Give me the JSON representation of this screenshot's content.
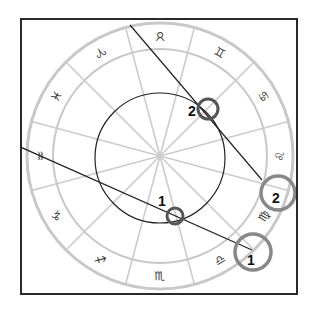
{
  "diagram": {
    "type": "zodiac-wheel",
    "colors": {
      "frame": "#2a2a2a",
      "wheel_ring": "#c8c8c8",
      "spokes": "#cccccc",
      "inner_circle": "#222222",
      "lines": "#222222",
      "small_markers": "#555555",
      "large_markers": "#888888"
    },
    "signs": [
      {
        "name": "taurus",
        "glyph": "♉"
      },
      {
        "name": "aries-mirrored",
        "glyph": "♈"
      },
      {
        "name": "pisces",
        "glyph": "♓"
      },
      {
        "name": "aquarius",
        "glyph": "♒"
      },
      {
        "name": "capricorn",
        "glyph": "♑"
      },
      {
        "name": "sagittarius",
        "glyph": "♐"
      },
      {
        "name": "scorpio",
        "glyph": "♏"
      },
      {
        "name": "libra",
        "glyph": "♎"
      },
      {
        "name": "virgo",
        "glyph": "♍"
      },
      {
        "name": "leo",
        "glyph": "♌"
      },
      {
        "name": "cancer",
        "glyph": "♋"
      },
      {
        "name": "gemini",
        "glyph": "♊"
      }
    ],
    "markers": {
      "small_1": {
        "label": "1"
      },
      "small_2": {
        "label": "2"
      },
      "large_1": {
        "label": "1"
      },
      "large_2": {
        "label": "2"
      }
    }
  }
}
